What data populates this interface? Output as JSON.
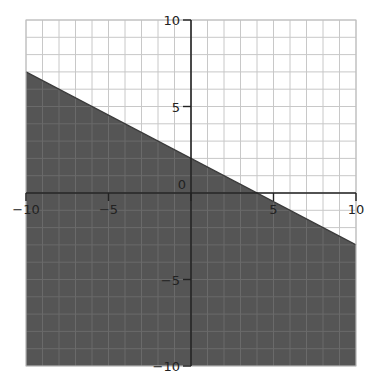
{
  "chart_data": {
    "type": "area",
    "title": "",
    "inequality": "y <= -0.5x + 2",
    "boundary": {
      "slope": -0.5,
      "intercept": 2,
      "style": "solid",
      "points": [
        [
          -10,
          7
        ],
        [
          4,
          0
        ],
        [
          10,
          -3
        ]
      ]
    },
    "shaded_region": "below",
    "xlim": [
      -10,
      10
    ],
    "ylim": [
      -10,
      10
    ],
    "grid": true,
    "grid_step": 1,
    "x_ticks": [
      -10,
      -5,
      0,
      5,
      10
    ],
    "y_ticks": [
      -10,
      -5,
      5,
      10
    ],
    "x_tick_labels": [
      "−10",
      "−5",
      "0",
      "5",
      "10"
    ],
    "y_tick_labels": [
      "−10",
      "−5",
      "5",
      "10"
    ],
    "xlabel": "",
    "ylabel": "",
    "colors": {
      "shade": "#555555",
      "grid": "#c8c8c8",
      "axis": "#222222",
      "background": "#ffffff"
    }
  }
}
